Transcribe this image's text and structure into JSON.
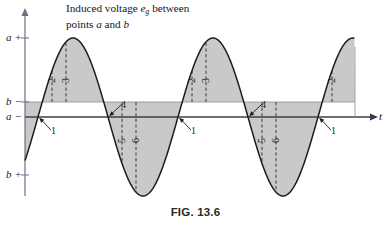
{
  "figure": {
    "caption": "FIG. 13.6",
    "title_line1_pre": "Induced voltage ",
    "title_line1_symbol": "e",
    "title_line1_sub": "g",
    "title_line1_post": " between",
    "title_line2_pre": "points ",
    "title_line2_a": "a",
    "title_line2_mid": " and ",
    "title_line2_b": "b"
  },
  "axes": {
    "x_label": "t",
    "y_ticks": [
      {
        "name": "a-plus",
        "letter": "a",
        "sign": "+",
        "y": 38
      },
      {
        "name": "b-minus",
        "letter": "b",
        "sign": "−",
        "y": 102
      },
      {
        "name": "a-minus",
        "letter": "a",
        "sign": "−",
        "y": 117
      },
      {
        "name": "b-plus",
        "letter": "b",
        "sign": "+",
        "y": 175
      }
    ]
  },
  "markers": [
    {
      "label": "1",
      "kind": "arrow",
      "x": 38,
      "y": 117
    },
    {
      "label": "2",
      "kind": "dashed",
      "x": 52,
      "y": 80
    },
    {
      "label": "3",
      "kind": "dashed",
      "x": 66,
      "y": 80
    },
    {
      "label": "4",
      "kind": "arrow",
      "x": 108,
      "y": 117
    },
    {
      "label": "5",
      "kind": "dashed",
      "x": 122,
      "y": 140
    },
    {
      "label": "6",
      "kind": "dashed",
      "x": 136,
      "y": 140
    },
    {
      "label": "1",
      "kind": "arrow",
      "x": 178,
      "y": 117
    },
    {
      "label": "2",
      "kind": "dashed",
      "x": 192,
      "y": 80
    },
    {
      "label": "3",
      "kind": "dashed",
      "x": 206,
      "y": 80
    },
    {
      "label": "4",
      "kind": "arrow",
      "x": 248,
      "y": 117
    },
    {
      "label": "5",
      "kind": "dashed",
      "x": 262,
      "y": 140
    },
    {
      "label": "6",
      "kind": "dashed",
      "x": 276,
      "y": 140
    },
    {
      "label": "1",
      "kind": "arrow",
      "x": 318,
      "y": 117
    },
    {
      "label": "2",
      "kind": "dashed",
      "x": 332,
      "y": 80
    }
  ],
  "chart_data": {
    "type": "line",
    "xlabel": "t",
    "ylabel": "",
    "grid": false,
    "legend": false,
    "waveform": "sine",
    "amplitude": 1.0,
    "period_px": 140,
    "zero_crossing_px": 38,
    "baseline_px": 117,
    "peak_px": 38,
    "trough_px": 175,
    "shade_reference_px": 102,
    "truncated_at_px": 355,
    "fill_color": "#c9c9c9",
    "curve_color": "#1c1c1c",
    "x": [
      0,
      0.125,
      0.25,
      0.375,
      0.5,
      0.625,
      0.75,
      0.875,
      1.0,
      1.125,
      1.25,
      1.375,
      1.5,
      1.625,
      1.75,
      1.875,
      2.0,
      2.125,
      2.25,
      2.375
    ],
    "y": [
      0,
      0.707,
      1.0,
      0.707,
      0,
      -0.707,
      -1.0,
      -0.707,
      0,
      0.707,
      1.0,
      0.707,
      0,
      -0.707,
      -1.0,
      -0.707,
      0,
      0.707,
      1.0,
      0.924
    ],
    "annotations": [
      {
        "text": "1",
        "x": 0.0,
        "y": 0.0,
        "note": "ascending zero crossing"
      },
      {
        "text": "2",
        "x": 0.1,
        "y": 0.59,
        "note": "rising edge"
      },
      {
        "text": "3",
        "x": 0.2,
        "y": 0.95,
        "note": "near positive peak"
      },
      {
        "text": "4",
        "x": 0.5,
        "y": 0.0,
        "note": "descending zero crossing"
      },
      {
        "text": "5",
        "x": 0.6,
        "y": -0.59,
        "note": "falling edge"
      },
      {
        "text": "6",
        "x": 0.7,
        "y": -0.95,
        "note": "near negative peak"
      }
    ]
  },
  "colors": {
    "fill": "#c9c9c9",
    "curve": "#1c1c1c",
    "axis": "#6e6e86",
    "text": "#1a1a1a"
  }
}
